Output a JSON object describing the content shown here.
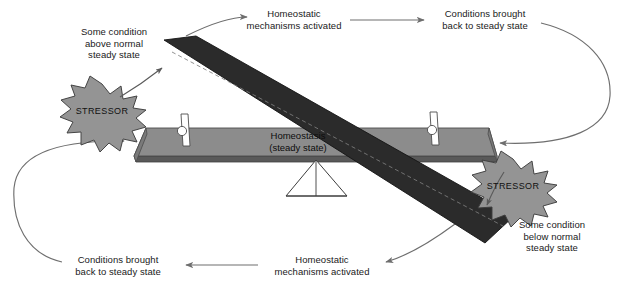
{
  "diagram": {
    "type": "concept-diagram",
    "colors": {
      "platform_top": "#8c8c8c",
      "platform_edge": "#595959",
      "beam": "#2b2b2b",
      "stressor_fill": "#949494",
      "stressor_stroke": "#3d3d3d",
      "arrow": "#6e6e6e",
      "text": "#1a1a1a",
      "background": "#ffffff",
      "peg_fill": "#ffffff",
      "peg_stroke": "#4d4d4d"
    }
  },
  "platform": {
    "label_line1": "Homeostasis",
    "label_line2": "(steady state)",
    "label": "Homeostasis\n(steady state)"
  },
  "fulcrum": {
    "name": "triangular fulcrum"
  },
  "pegs": [
    {
      "name": "left-peg"
    },
    {
      "name": "right-peg"
    }
  ],
  "beam": {
    "name": "tilted beam"
  },
  "stressors": [
    {
      "id": "stressor-left",
      "label": "STRESSOR"
    },
    {
      "id": "stressor-right",
      "label": "STRESSOR"
    }
  ],
  "labels": {
    "condition_above": "Some condition\nabove normal\nsteady state",
    "mechanisms_top": "Homeostatic\nmechanisms activated",
    "restored_top": "Conditions brought\nback to steady state",
    "condition_below": "Some condition\nbelow normal\nsteady state",
    "mechanisms_bottom": "Homeostatic\nmechanisms activated",
    "restored_bottom": "Conditions brought\nback to steady state"
  },
  "arrows": [
    {
      "id": "arrow-stressor-left-to-beam",
      "from": "stressor-left",
      "to": "beam-high-end"
    },
    {
      "id": "arrow-beam-to-mechanisms-top",
      "from": "condition-above",
      "to": "mechanisms-top"
    },
    {
      "id": "arrow-mechanisms-to-restored-top",
      "from": "mechanisms-top",
      "to": "restored-top"
    },
    {
      "id": "arrow-restored-top-to-platform",
      "from": "restored-top",
      "to": "platform-right"
    },
    {
      "id": "arrow-stressor-right-to-beam",
      "from": "stressor-right",
      "to": "beam-low-end"
    },
    {
      "id": "arrow-beam-to-mechanisms-bottom",
      "from": "condition-below",
      "to": "mechanisms-bottom"
    },
    {
      "id": "arrow-mechanisms-to-restored-bot",
      "from": "mechanisms-bottom",
      "to": "restored-bottom"
    },
    {
      "id": "arrow-restored-bot-to-platform",
      "from": "restored-bottom",
      "to": "platform-left"
    }
  ]
}
